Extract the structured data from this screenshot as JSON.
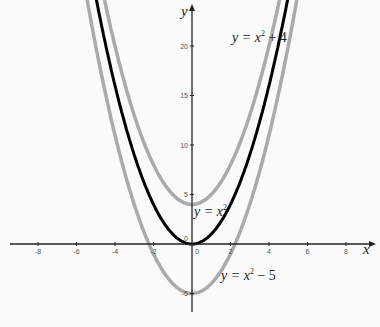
{
  "chart_data": {
    "type": "line",
    "title": "",
    "xlabel": "x",
    "ylabel": "y",
    "xlim": [
      -9,
      9.5
    ],
    "ylim": [
      -8,
      23
    ],
    "grid": false,
    "x_ticks": [
      -8,
      -6,
      -4,
      -2,
      0,
      2,
      4,
      6,
      8
    ],
    "y_ticks": [
      -5,
      0,
      5,
      10,
      15,
      20
    ],
    "series": [
      {
        "name": "y = x² + 4",
        "formula": "x^2+4",
        "color": "#aaaaaa",
        "vertex": [
          0,
          4
        ]
      },
      {
        "name": "y = x²",
        "formula": "x^2",
        "color": "#000000",
        "vertex": [
          0,
          0
        ]
      },
      {
        "name": "y = x² − 5",
        "formula": "x^2-5",
        "color": "#aaaaaa",
        "vertex": [
          0,
          -5
        ]
      }
    ],
    "annotations": [
      {
        "text": "y = x² + 4",
        "x": 2,
        "y": 21
      },
      {
        "text": "y = x²",
        "x": 0.5,
        "y": 2.5
      },
      {
        "text": "y = x² − 5",
        "x": 1.5,
        "y": -2.5
      }
    ]
  },
  "labels": {
    "x_axis": "x",
    "y_axis": "y",
    "origin": "0",
    "eq_top": {
      "lhs": "y = x",
      "sup": "2",
      "rhs": " + 4"
    },
    "eq_mid": {
      "lhs": "y = x",
      "sup": "2",
      "rhs": ""
    },
    "eq_bot": {
      "lhs": "y = x",
      "sup": "2",
      "rhs": " − 5"
    }
  },
  "colors": {
    "primary_curve": "#000000",
    "shifted_curves": "#aaaaaa",
    "axes": "#222222"
  }
}
